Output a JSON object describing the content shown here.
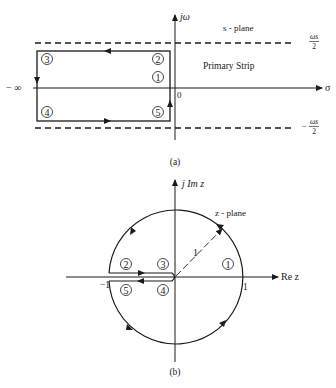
{
  "figure_a": {
    "caption": "(a)",
    "vertical_axis_label": "jω",
    "horizontal_axis_label": "σ",
    "plane_label": "s - plane",
    "region_label": "Primary Strip",
    "upper_bound_numerator": "ωs",
    "upper_bound_denominator": "2",
    "lower_bound_sign": "−",
    "lower_bound_numerator": "ωs",
    "lower_bound_denominator": "2",
    "left_limit": "− ∞",
    "origin_label": "0",
    "contour_points": [
      "1",
      "2",
      "3",
      "4",
      "5"
    ]
  },
  "figure_b": {
    "caption": "(b)",
    "vertical_axis_label": "j Im z",
    "horizontal_axis_label": "Re z",
    "plane_label": "z - plane",
    "radius_label": "1",
    "unit_right": "1",
    "unit_left": "−1",
    "contour_points": [
      "1",
      "2",
      "3",
      "4",
      "5"
    ]
  },
  "colors": {
    "ink": "#1a1a1a",
    "background": "#ffffff"
  }
}
